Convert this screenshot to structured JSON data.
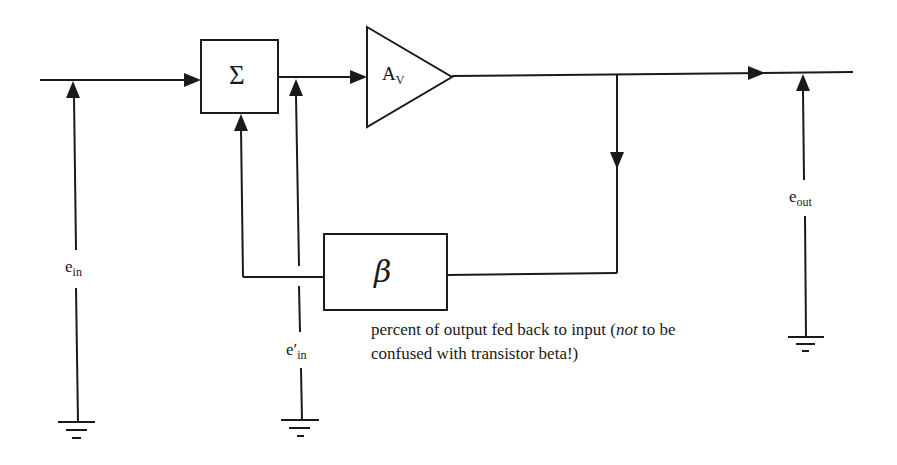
{
  "diagram": {
    "blocks": {
      "summer": {
        "symbol": "Σ"
      },
      "amplifier": {
        "main": "A",
        "sub": "V"
      },
      "feedback": {
        "symbol": "β"
      }
    },
    "signals": {
      "e_in": {
        "main": "e",
        "sub": "in"
      },
      "e_prime_in": {
        "main": "e′",
        "sub": "in"
      },
      "e_out": {
        "main": "e",
        "sub": "out"
      }
    },
    "annotation": {
      "line1_pre": "percent of output fed back to input (",
      "line1_italic": "not",
      "line1_post": " to be",
      "line2": "confused with transistor beta!)"
    },
    "colors": {
      "ink": "#1a1a1a",
      "background": "#ffffff"
    }
  }
}
